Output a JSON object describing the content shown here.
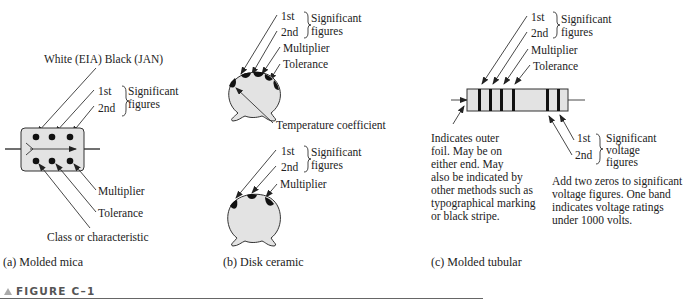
{
  "figure": {
    "label": "FIGURE C–1",
    "marker_icon": "triangle-up-icon",
    "rule_color": "#666666"
  },
  "panels": [
    {
      "id": "a",
      "caption": "(a) Molded mica",
      "labels": {
        "white_black": "White (EIA) Black (JAN)",
        "first": "1st",
        "second": "2nd",
        "sig1": "Significant",
        "sig2": "figures",
        "multiplier": "Multiplier",
        "tolerance": "Tolerance",
        "class": "Class or characteristic"
      }
    },
    {
      "id": "b",
      "caption": "(b) Disk ceramic",
      "top": {
        "first": "1st",
        "second": "2nd",
        "sig1": "Significant",
        "sig2": "figures",
        "multiplier": "Multiplier",
        "tolerance": "Tolerance",
        "temp": "Temperature coefficient"
      },
      "bottom": {
        "first": "1st",
        "second": "2nd",
        "sig1": "Significant",
        "sig2": "figures",
        "multiplier": "Multiplier"
      }
    },
    {
      "id": "c",
      "caption": "(c) Molded tubular",
      "labels": {
        "first": "1st",
        "second": "2nd",
        "sig1": "Significant",
        "sig2": "figures",
        "multiplier": "Multiplier",
        "tolerance": "Tolerance",
        "v_first": "1st",
        "v_second": "2nd",
        "v_sig1": "Significant",
        "v_sig2": "voltage",
        "v_sig3": "figures"
      },
      "foil_note": [
        "Indicates outer",
        "foil.  May be on",
        "either end.  May",
        "also be indicated by",
        "other methods such as",
        "typographical marking",
        "or black stripe."
      ],
      "voltage_note": [
        "Add two zeros to significant",
        "voltage figures.  One band",
        "indicates voltage ratings",
        "under 1000 volts."
      ]
    }
  ]
}
